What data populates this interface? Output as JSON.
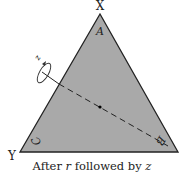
{
  "diagram": {
    "vertices": {
      "top": "X",
      "bottom_left": "Y"
    },
    "corner_labels": {
      "top": "A",
      "bottom_left": "C",
      "bottom_right": "B"
    },
    "rotation_axis_label": "z",
    "caption_prefix": "After ",
    "caption_var1": "r",
    "caption_mid": " followed by ",
    "caption_var2": "z",
    "colors": {
      "triangle_fill": "#a9a9a9",
      "stroke": "#222222"
    }
  }
}
